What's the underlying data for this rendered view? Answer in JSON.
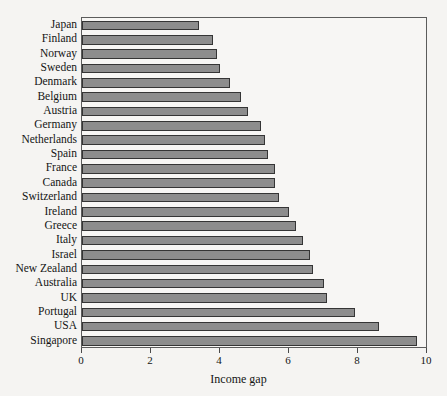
{
  "chart_data": {
    "type": "bar",
    "orientation": "horizontal",
    "title": "",
    "subtitle": "",
    "xlabel": "Income gap",
    "ylabel": "",
    "xlim": [
      0,
      10
    ],
    "xticks": [
      0,
      2,
      4,
      6,
      8,
      10
    ],
    "xtick_labels": [
      "0",
      "2",
      "4",
      "6",
      "8",
      "10"
    ],
    "grid": false,
    "legend": null,
    "bar_color": "#8d8d8d",
    "bar_border_color": "#353535",
    "background_color": "#f5f4f2",
    "frame_color": "#5c5c5c",
    "categories": [
      "Japan",
      "Finland",
      "Norway",
      "Sweden",
      "Denmark",
      "Belgium",
      "Austria",
      "Germany",
      "Netherlands",
      "Spain",
      "France",
      "Canada",
      "Switzerland",
      "Ireland",
      "Greece",
      "Italy",
      "Israel",
      "New Zealand",
      "Australia",
      "UK",
      "Portugal",
      "USA",
      "Singapore"
    ],
    "values": [
      3.4,
      3.8,
      3.9,
      4.0,
      4.3,
      4.6,
      4.8,
      5.2,
      5.3,
      5.4,
      5.6,
      5.6,
      5.7,
      6.0,
      6.2,
      6.4,
      6.6,
      6.7,
      7.0,
      7.1,
      7.9,
      8.6,
      9.7
    ]
  }
}
